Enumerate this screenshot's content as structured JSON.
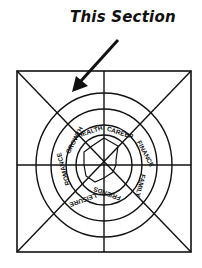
{
  "annotation": {
    "text": "This Section",
    "arrow": "arrow-pointing-to-top-left-sector"
  },
  "wheel": {
    "segments": [
      "HEALTH",
      "CAREER",
      "FINANCE",
      "FAMILY",
      "FRIENDS",
      "LEISURE",
      "ROMANCE",
      "GROWTH"
    ],
    "rings": 4,
    "spokes": 8
  },
  "colors": {
    "ink": "#111111",
    "background": "#ffffff"
  }
}
